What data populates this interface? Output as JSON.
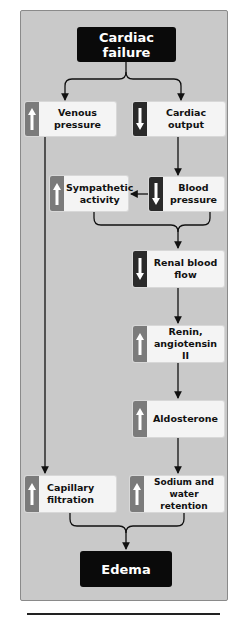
{
  "diagram": {
    "title": "Cardiac failure",
    "outcome": "Edema",
    "colors": {
      "panel_bg": "#c9c9c9",
      "box_bg": "#f4f4f4",
      "terminal_bg": "#0a0a0a",
      "increase_indicator": "#7b7b7b",
      "decrease_indicator": "#2a2a2a"
    },
    "nodes": {
      "venous_pressure": {
        "label": "Venous pressure",
        "direction": "increase"
      },
      "cardiac_output": {
        "label": "Cardiac output",
        "direction": "decrease"
      },
      "sympathetic_activity": {
        "label": "Sympathetic activity",
        "direction": "increase"
      },
      "blood_pressure": {
        "label": "Blood pressure",
        "direction": "decrease"
      },
      "renal_blood_flow": {
        "label": "Renal blood flow",
        "direction": "decrease"
      },
      "renin_angiotensin": {
        "label": "Renin, angiotensin II",
        "direction": "increase"
      },
      "aldosterone": {
        "label": "Aldosterone",
        "direction": "increase"
      },
      "capillary_filtration": {
        "label": "Capillary filtration",
        "direction": "increase"
      },
      "sodium_water_retention": {
        "label": "Sodium and water retention",
        "direction": "increase"
      }
    },
    "edges": [
      [
        "Cardiac failure",
        "Venous pressure"
      ],
      [
        "Cardiac failure",
        "Cardiac output"
      ],
      [
        "Cardiac output",
        "Blood pressure"
      ],
      [
        "Blood pressure",
        "Sympathetic activity"
      ],
      [
        "Sympathetic activity",
        "Renal blood flow"
      ],
      [
        "Blood pressure",
        "Renal blood flow"
      ],
      [
        "Renal blood flow",
        "Renin, angiotensin II"
      ],
      [
        "Renin, angiotensin II",
        "Aldosterone"
      ],
      [
        "Aldosterone",
        "Sodium and water retention"
      ],
      [
        "Venous pressure",
        "Capillary filtration"
      ],
      [
        "Capillary filtration",
        "Edema"
      ],
      [
        "Sodium and water retention",
        "Edema"
      ]
    ]
  }
}
